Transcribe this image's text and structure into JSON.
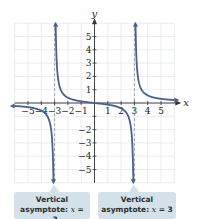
{
  "chart_data": {
    "type": "line",
    "function": "f(x) = x/(x^2 - 9)",
    "xlabel": "x",
    "ylabel": "y",
    "xlim": [
      -6,
      6
    ],
    "ylim": [
      -6,
      6
    ],
    "grid": true,
    "x_ticks": [
      -5,
      -4,
      -3,
      -2,
      -1,
      1,
      2,
      3,
      4,
      5
    ],
    "y_ticks": [
      -5,
      -4,
      -3,
      -2,
      -1,
      1,
      2,
      3,
      4,
      5
    ],
    "asymptotes": [
      {
        "type": "vertical",
        "x": -3
      },
      {
        "type": "vertical",
        "x": 3
      }
    ],
    "series": [
      {
        "name": "left branch",
        "x": [
          -6,
          -5,
          -4,
          -3.5,
          -3.2,
          -3.1
        ],
        "y": [
          -0.22,
          -0.31,
          -0.57,
          -1.08,
          -2.58,
          -5.08
        ]
      },
      {
        "name": "middle branch",
        "x": [
          -2.9,
          -2.8,
          -2.5,
          -2,
          -1,
          0,
          1,
          2,
          2.5,
          2.8,
          2.9
        ],
        "y": [
          4.93,
          2.41,
          0.91,
          0.4,
          0.125,
          0,
          -0.125,
          -0.4,
          -0.91,
          -2.41,
          -4.93
        ]
      },
      {
        "name": "right branch",
        "x": [
          3.1,
          3.2,
          3.5,
          4,
          5,
          6
        ],
        "y": [
          5.08,
          2.58,
          1.08,
          0.57,
          0.31,
          0.22
        ]
      }
    ],
    "annotations": [
      {
        "text": "Vertical asymptote: x = −3",
        "x": -3
      },
      {
        "text": "Vertical asymptote: x = 3",
        "x": 3
      }
    ]
  },
  "axes": {
    "x_label": "x",
    "y_label": "y",
    "x_tick_labels": [
      "−5",
      "−4",
      "−3",
      "−2",
      "−1",
      "1",
      "2",
      "3",
      "4",
      "5"
    ],
    "y_tick_labels": [
      "5",
      "4",
      "3",
      "2",
      "1",
      "−1",
      "−2",
      "−3",
      "−4",
      "−5"
    ]
  },
  "callouts": [
    {
      "line1": "Vertical",
      "line2_prefix": "asymptote: ",
      "var": "x",
      "eq": " = ",
      "value": "−3"
    },
    {
      "line1": "Vertical",
      "line2_prefix": "asymptote: ",
      "var": "x",
      "eq": " = ",
      "value": "3"
    }
  ],
  "colors": {
    "curve": "#4a5f8c",
    "asymptote": "#8a9aa8",
    "grid": "#e3e6ea",
    "axis": "#333333",
    "callout_fill": "#d3e2e8"
  }
}
